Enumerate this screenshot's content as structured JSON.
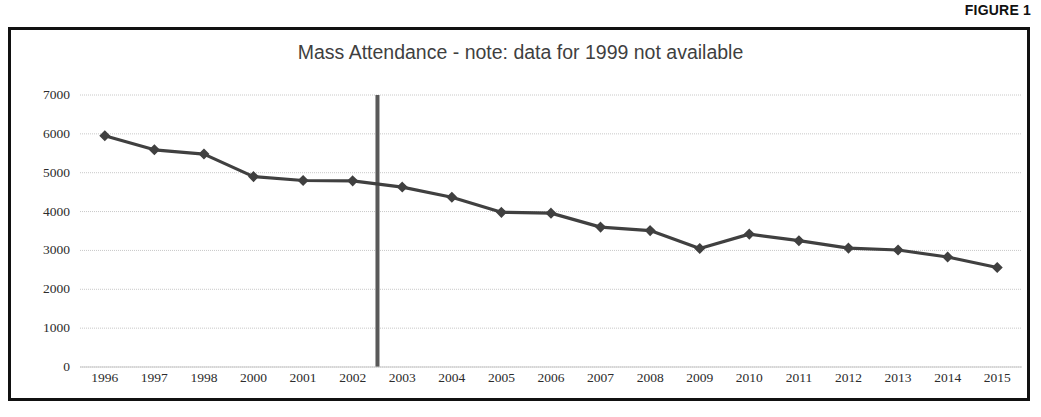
{
  "figure": {
    "label": "FIGURE 1"
  },
  "chart_data": {
    "type": "line",
    "title": "Mass Attendance - note: data for 1999 not available",
    "xlabel": "",
    "ylabel": "",
    "categories": [
      "1996",
      "1997",
      "1998",
      "2000",
      "2001",
      "2002",
      "2003",
      "2004",
      "2005",
      "2006",
      "2007",
      "2008",
      "2009",
      "2010",
      "2011",
      "2012",
      "2013",
      "2014",
      "2015"
    ],
    "values": [
      5950,
      5590,
      5480,
      4900,
      4800,
      4790,
      4630,
      4370,
      3980,
      3960,
      3600,
      3510,
      3050,
      3420,
      3250,
      3060,
      3010,
      2830,
      2560
    ],
    "yticks": [
      0,
      1000,
      2000,
      3000,
      4000,
      5000,
      6000,
      7000
    ],
    "ytick_labels": [
      "0",
      "1000",
      "2000",
      "3000",
      "4000",
      "5000",
      "6000",
      "7000"
    ],
    "ylim": [
      0,
      7000
    ],
    "grid": true,
    "legend": false,
    "series_color": "#404040",
    "marker": "diamond",
    "annotations": [
      {
        "name": "vertical-divider",
        "after_category": "2002",
        "color": "#595959"
      }
    ]
  }
}
